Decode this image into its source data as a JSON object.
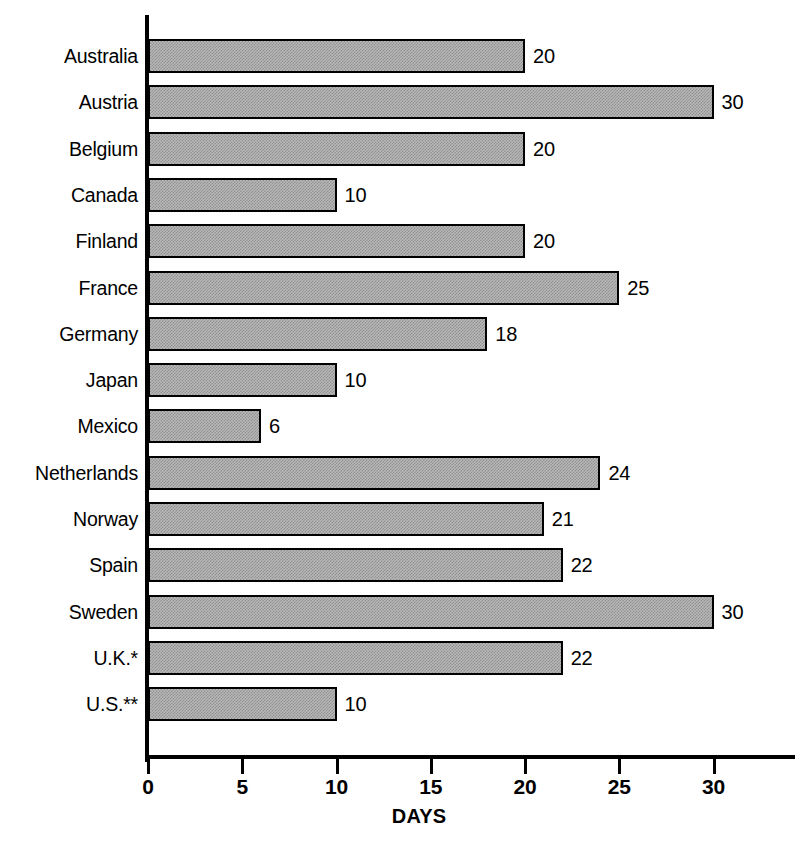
{
  "chart_data": {
    "type": "bar",
    "orientation": "horizontal",
    "title": "",
    "xlabel": "DAYS",
    "ylabel": "",
    "xlim": [
      0,
      34
    ],
    "xticks": [
      0,
      5,
      10,
      15,
      20,
      25,
      30
    ],
    "xtick_labels": [
      "0",
      "5",
      "10",
      "15",
      "20",
      "25",
      "30"
    ],
    "grid": false,
    "legend": null,
    "bar_fill": "#b9b9b9",
    "bar_edge": "#000000",
    "background": "#ffffff",
    "categories": [
      "Australia",
      "Austria",
      "Belgium",
      "Canada",
      "Finland",
      "France",
      "Germany",
      "Japan",
      "Mexico",
      "Netherlands",
      "Norway",
      "Spain",
      "Sweden",
      "U.K.*",
      "U.S.**"
    ],
    "values": [
      20,
      30,
      20,
      10,
      20,
      25,
      18,
      10,
      6,
      24,
      21,
      22,
      30,
      22,
      10
    ],
    "value_labels": [
      "20",
      "30",
      "20",
      "10",
      "20",
      "25",
      "18",
      "10",
      "6",
      "24",
      "21",
      "22",
      "30",
      "22",
      "10"
    ]
  }
}
